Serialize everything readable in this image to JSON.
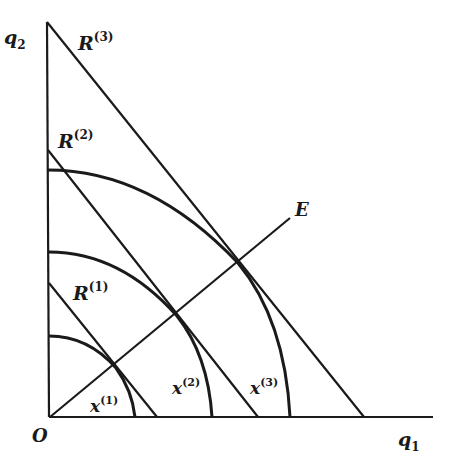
{
  "diagram": {
    "colors": {
      "ink": "#1a1a1a",
      "background": "#ffffff"
    },
    "axes": {
      "origin_label": "O",
      "x_label": "q",
      "x_sub": "1",
      "y_label": "q",
      "y_sub": "2"
    },
    "budget_lines": [
      {
        "label": "R",
        "sup": "(1)"
      },
      {
        "label": "R",
        "sup": "(2)"
      },
      {
        "label": "R",
        "sup": "(3)"
      }
    ],
    "indifference_curves": [
      {
        "label": "x",
        "sup": "(1)"
      },
      {
        "label": "x",
        "sup": "(2)"
      },
      {
        "label": "x",
        "sup": "(3)"
      }
    ],
    "expansion_path": {
      "label": "E"
    }
  }
}
